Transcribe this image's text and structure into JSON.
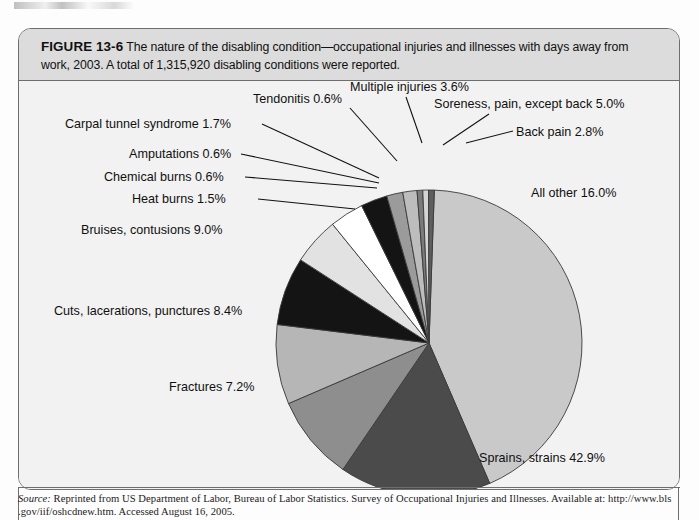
{
  "figure": {
    "label": "FIGURE 13-6",
    "caption": "The nature of the disabling condition—occupational injuries and illnesses with days away from work, 2003. A total of 1,315,920 disabling conditions were reported."
  },
  "source": {
    "label": "Source:",
    "text": " Reprinted from US Department of Labor, Bureau of Labor Statistics. Survey of Occupational Injuries and Illnesses. Available at: http://www.bls",
    "line2": ".gov/iif/oshcdnew.htm. Accessed August 16, 2005."
  },
  "chart_data": {
    "type": "pie",
    "title": "The nature of the disabling condition—occupational injuries and illnesses with days away from work, 2003",
    "total_label": "A total of 1,315,920 disabling conditions were reported.",
    "total": 1315920,
    "units": "percent",
    "legend": "none",
    "labels": [
      "Sprains, strains 42.9%",
      "All other 16.0%",
      "Bruises, contusions 9.0%",
      "Cuts, lacerations, punctures 8.4%",
      "Fractures 7.2%",
      "Soreness, pain, except back 5.0%",
      "Multiple injuries 3.6%",
      "Back pain 2.8%",
      "Carpal tunnel syndrome 1.7%",
      "Heat burns 1.5%",
      "Tendonitis 0.6%",
      "Amputations 0.6%",
      "Chemical burns 0.6%"
    ],
    "slices": [
      {
        "name": "Sprains, strains",
        "value": 42.9,
        "label": "Sprains, strains 42.9%",
        "color": "#c9c9c9"
      },
      {
        "name": "All other",
        "value": 16.0,
        "label": "All other 16.0%",
        "color": "#4b4b4b"
      },
      {
        "name": "Bruises, contusions",
        "value": 9.0,
        "label": "Bruises, contusions 9.0%",
        "color": "#8e8e8e"
      },
      {
        "name": "Cuts, lacerations, punctures",
        "value": 8.4,
        "label": "Cuts, lacerations, punctures 8.4%",
        "color": "#b6b6b6"
      },
      {
        "name": "Fractures",
        "value": 7.2,
        "label": "Fractures 7.2%",
        "color": "#141414"
      },
      {
        "name": "Soreness, pain, except back",
        "value": 5.0,
        "label": "Soreness, pain, except back 5.0%",
        "color": "#e2e2e2"
      },
      {
        "name": "Multiple injuries",
        "value": 3.6,
        "label": "Multiple injuries 3.6%",
        "color": "#ffffff"
      },
      {
        "name": "Back pain",
        "value": 2.8,
        "label": "Back pain 2.8%",
        "color": "#141414"
      },
      {
        "name": "Carpal tunnel syndrome",
        "value": 1.7,
        "label": "Carpal tunnel syndrome 1.7%",
        "color": "#9b9b9b"
      },
      {
        "name": "Heat burns",
        "value": 1.5,
        "label": "Heat burns 1.5%",
        "color": "#bdbdbd"
      },
      {
        "name": "Tendonitis",
        "value": 0.6,
        "label": "Tendonitis 0.6%",
        "color": "#7a7a7a"
      },
      {
        "name": "Amputations",
        "value": 0.6,
        "label": "Amputations 0.6%",
        "color": "#d4d4d4"
      },
      {
        "name": "Chemical burns",
        "value": 0.6,
        "label": "Chemical burns 0.6%",
        "color": "#5e5e5e"
      }
    ]
  },
  "labels_layout": [
    {
      "key": "carpal",
      "bind": "chart_data.slices.8.label",
      "x": 46,
      "y": 47,
      "anchor": "start",
      "line": [
        [
          243,
          43
        ],
        [
          360,
          97
        ]
      ]
    },
    {
      "key": "tendonitis",
      "bind": "chart_data.slices.10.label",
      "x": 234,
      "y": 22,
      "anchor": "start",
      "line": [
        [
          331,
          27
        ],
        [
          378,
          80
        ]
      ]
    },
    {
      "key": "multiple",
      "bind": "chart_data.slices.6.label",
      "x": 331,
      "y": 10,
      "anchor": "start",
      "line": [
        [
          387,
          16
        ],
        [
          403,
          62
        ]
      ]
    },
    {
      "key": "soreness",
      "bind": "chart_data.slices.5.label",
      "x": 415,
      "y": 27,
      "anchor": "start",
      "line": [
        [
          470,
          33
        ],
        [
          424,
          64
        ]
      ]
    },
    {
      "key": "backpain",
      "bind": "chart_data.slices.7.label",
      "x": 497,
      "y": 55,
      "anchor": "start",
      "line": [
        [
          494,
          50
        ],
        [
          447,
          62
        ]
      ]
    },
    {
      "key": "amputations",
      "bind": "chart_data.slices.11.label",
      "x": 110,
      "y": 77,
      "anchor": "start",
      "line": [
        [
          222,
          73
        ],
        [
          360,
          102
        ]
      ]
    },
    {
      "key": "chemical",
      "bind": "chart_data.slices.12.label",
      "x": 85,
      "y": 100,
      "anchor": "start",
      "line": [
        [
          226,
          96
        ],
        [
          358,
          107
        ]
      ]
    },
    {
      "key": "heat",
      "bind": "chart_data.slices.9.label",
      "x": 113,
      "y": 122,
      "anchor": "start",
      "line": [
        [
          239,
          118
        ],
        [
          336,
          128
        ]
      ]
    },
    {
      "key": "bruises",
      "bind": "chart_data.slices.2.label",
      "x": 62,
      "y": 153,
      "anchor": "start",
      "line": null
    },
    {
      "key": "cuts",
      "bind": "chart_data.slices.3.label",
      "x": 35,
      "y": 234,
      "anchor": "start",
      "line": null
    },
    {
      "key": "fractures",
      "bind": "chart_data.slices.4.label",
      "x": 150,
      "y": 310,
      "anchor": "start",
      "line": null
    },
    {
      "key": "allother",
      "bind": "chart_data.slices.1.label",
      "x": 512,
      "y": 116,
      "anchor": "start",
      "line": null
    },
    {
      "key": "sprains",
      "bind": "chart_data.slices.0.label",
      "x": 460,
      "y": 381,
      "anchor": "start",
      "line": null
    }
  ],
  "geometry": {
    "cx": 410,
    "cy": 262,
    "r": 153,
    "start_angle_deg": -88
  }
}
